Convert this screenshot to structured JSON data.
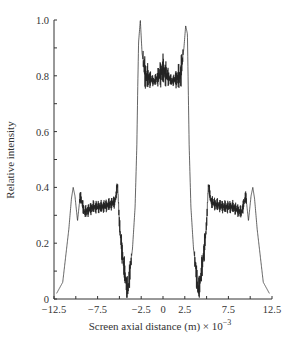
{
  "chart_data": {
    "type": "line",
    "title": "",
    "xlabel": "Screen axial distance (m) × 10",
    "xlabel_exp": "−3",
    "ylabel": "Relative intensity",
    "xlim": [
      -12.5,
      12.5
    ],
    "ylim": [
      0,
      1.0
    ],
    "grid": false,
    "legend": null,
    "x_ticks": [
      -12.5,
      -10,
      -7.5,
      -5,
      -2.5,
      0,
      2.5,
      5,
      7.5,
      10,
      12.5
    ],
    "x_tick_labels": [
      "−12.5",
      "−7.5",
      "−2.5",
      "0",
      "2.5",
      "7.5",
      "12.5"
    ],
    "x_tick_label_values": [
      -12.5,
      -7.5,
      -2.5,
      0,
      2.5,
      7.5,
      12.5
    ],
    "y_ticks": [
      0,
      0.1,
      0.2,
      0.3,
      0.4,
      0.5,
      0.6,
      0.7,
      0.8,
      0.9,
      1.0
    ],
    "y_tick_labels": [
      "0",
      "0.2",
      "0.4",
      "0.6",
      "0.8",
      "1.0"
    ],
    "y_tick_label_values": [
      0,
      0.2,
      0.4,
      0.6,
      0.8,
      1.0
    ],
    "series": [
      {
        "name": "Relative intensity",
        "color": "#333333",
        "x": [
          -12.2,
          -11.5,
          -10.8,
          -10.5,
          -10.3,
          -10.1,
          -9.8,
          -9.5,
          -9.0,
          -8.0,
          -7.0,
          -6.0,
          -5.5,
          -5.2,
          -5.0,
          -4.8,
          -4.5,
          -4.2,
          -4.0,
          -3.8,
          -3.5,
          -3.2,
          -3.0,
          -2.9,
          -2.8,
          -2.6,
          -2.4,
          -2.0,
          -1.0,
          0.0,
          1.0,
          2.0,
          2.4,
          2.6,
          2.8,
          2.9,
          3.0,
          3.2,
          3.5,
          3.8,
          4.0,
          4.2,
          4.5,
          4.8,
          5.0,
          5.2,
          5.5,
          6.0,
          7.0,
          8.0,
          9.0,
          9.5,
          9.8,
          10.1,
          10.3,
          10.5,
          10.8,
          11.5,
          12.2
        ],
        "y": [
          0.02,
          0.06,
          0.25,
          0.36,
          0.4,
          0.37,
          0.28,
          0.37,
          0.31,
          0.33,
          0.33,
          0.34,
          0.35,
          0.41,
          0.27,
          0.2,
          0.12,
          0.05,
          0.03,
          0.1,
          0.18,
          0.33,
          0.55,
          0.75,
          0.92,
          1.0,
          0.88,
          0.8,
          0.78,
          0.82,
          0.78,
          0.8,
          0.9,
          0.98,
          0.95,
          0.75,
          0.55,
          0.33,
          0.18,
          0.1,
          0.03,
          0.05,
          0.12,
          0.2,
          0.27,
          0.41,
          0.35,
          0.34,
          0.33,
          0.33,
          0.31,
          0.37,
          0.28,
          0.37,
          0.4,
          0.36,
          0.25,
          0.06,
          0.02
        ]
      }
    ]
  }
}
